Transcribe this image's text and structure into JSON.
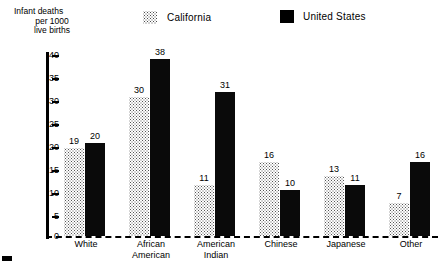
{
  "chart_data": {
    "type": "bar",
    "title": "",
    "xlabel": "",
    "ylabel": "Infant deaths per 1000 live births",
    "ylabel_lines": [
      "Infant deaths",
      "per 1000",
      "live births"
    ],
    "ylim": [
      0,
      40
    ],
    "yticks": [
      0,
      5,
      10,
      15,
      20,
      25,
      30,
      35,
      40
    ],
    "ytick_labels": [
      "0",
      "5",
      "10",
      "15",
      "20",
      "25",
      "30",
      "35",
      "40"
    ],
    "grid": false,
    "legend_position": "top",
    "categories": [
      "White",
      "African American",
      "American Indian",
      "Chinese",
      "Japanese",
      "Other"
    ],
    "category_lines": [
      [
        "White"
      ],
      [
        "African",
        "American"
      ],
      [
        "American",
        "Indian"
      ],
      [
        "Chinese"
      ],
      [
        "Japanese"
      ],
      [
        "Other"
      ]
    ],
    "series": [
      {
        "name": "California",
        "color": "#ffffff",
        "pattern": "dotted",
        "values": [
          19,
          30,
          11,
          16,
          13,
          7
        ],
        "value_labels": [
          "19",
          "30",
          "11",
          "16",
          "13",
          "7"
        ]
      },
      {
        "name": "United States",
        "color": "#000000",
        "pattern": "solid",
        "values": [
          20,
          38,
          31,
          10,
          11,
          16
        ],
        "value_labels": [
          "20",
          "38",
          "31",
          "10",
          "11",
          "16"
        ]
      }
    ]
  },
  "legend": {
    "items": [
      {
        "label": "California",
        "swatch": "dotted-swatch-icon"
      },
      {
        "label": "United States",
        "swatch": "black-swatch-icon"
      }
    ]
  }
}
